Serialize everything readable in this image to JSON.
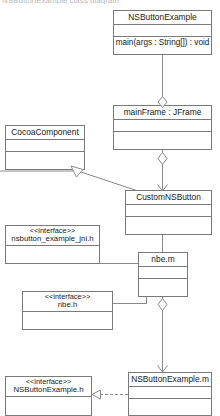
{
  "diagram": {
    "kind": "uml-class-diagram",
    "top_caption": "NSButtonExample class diagram",
    "stroke_color": "#8a8a8a",
    "background_color": "#ffffff",
    "text_color": "#1a1a1a"
  },
  "classes": [
    {
      "id": "nsbuttonexample",
      "name": "NSButtonExample",
      "stereotype": "",
      "attributes": "",
      "operations": "main(args : String[]) : void"
    },
    {
      "id": "mainframe",
      "name": "mainFrame : JFrame",
      "stereotype": "",
      "attributes": "",
      "operations": ""
    },
    {
      "id": "cocoacomponent",
      "name": "CocoaComponent",
      "stereotype": "",
      "attributes": "",
      "operations": ""
    },
    {
      "id": "customnsbutton",
      "name": "CustomNSButton",
      "stereotype": "",
      "attributes": "",
      "operations": ""
    },
    {
      "id": "nsbutton-example-jni-h",
      "name": "nsbutton_example_jni.h",
      "stereotype": "<<interface>>",
      "attributes": "",
      "operations": ""
    },
    {
      "id": "nbe-m",
      "name": "nbe.m",
      "stereotype": "",
      "attributes": "",
      "operations": ""
    },
    {
      "id": "nbe-h",
      "name": "nbe.h",
      "stereotype": "<<interface>>",
      "attributes": "",
      "operations": ""
    },
    {
      "id": "nsbuttonexample-h",
      "name": "NSButtonExample.h",
      "stereotype": "<<interface>>",
      "attributes": "",
      "operations": ""
    },
    {
      "id": "nsbuttonexample-m",
      "name": "NSButtonExample.m",
      "stereotype": "",
      "attributes": "",
      "operations": ""
    }
  ],
  "relationships": [
    {
      "id": "rel-nsbuttonexample-mainframe",
      "from": "nsbuttonexample",
      "to": "mainframe",
      "type": "aggregation"
    },
    {
      "id": "rel-mainframe-customnsbutton",
      "from": "mainframe",
      "to": "customnsbutton",
      "type": "aggregation-directed"
    },
    {
      "id": "rel-customnsbutton-cocoacomponent",
      "from": "customnsbutton",
      "to": "cocoacomponent",
      "type": "generalization"
    },
    {
      "id": "rel-customnsbutton-nbe-m",
      "from": "customnsbutton",
      "to": "nbe-m",
      "type": "association"
    },
    {
      "id": "rel-jni-h-nbe-m",
      "from": "nsbutton-example-jni-h",
      "to": "nbe-m",
      "type": "association"
    },
    {
      "id": "rel-nbe-h-nbe-m",
      "from": "nbe-h",
      "to": "nbe-m",
      "type": "association"
    },
    {
      "id": "rel-nbe-m-nsbuttonexample-m",
      "from": "nbe-m",
      "to": "nsbuttonexample-m",
      "type": "aggregation-directed"
    },
    {
      "id": "rel-nsbuttonexample-m-h",
      "from": "nsbuttonexample-m",
      "to": "nsbuttonexample-h",
      "type": "realization"
    }
  ]
}
